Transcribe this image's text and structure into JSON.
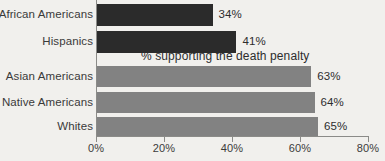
{
  "chart_data": {
    "type": "bar",
    "orientation": "horizontal",
    "title": "",
    "annotation": "% supporting the death penalty",
    "xlabel": "",
    "ylabel": "",
    "xlim": [
      0,
      80
    ],
    "grid": false,
    "legend": "none",
    "tick_labels": [
      "0%",
      "20%",
      "40%",
      "60%",
      "80%"
    ],
    "tick_values": [
      0,
      20,
      40,
      60,
      80
    ],
    "categories": [
      "African Americans",
      "Hispanics",
      "Asian Americans",
      "Native Americans",
      "Whites"
    ],
    "values": [
      34,
      41,
      63,
      64,
      65
    ],
    "value_labels": [
      "34%",
      "41%",
      "63%",
      "64%",
      "65%"
    ],
    "bar_colors": [
      "#2b2b2b",
      "#2b2b2b",
      "#828282",
      "#828282",
      "#828282"
    ],
    "bars": [
      {
        "category": "African Americans",
        "value": 34,
        "label": "34%",
        "color": "#2b2b2b",
        "top": 4,
        "height": 22
      },
      {
        "category": "Hispanics",
        "value": 41,
        "label": "41%",
        "color": "#2b2b2b",
        "top": 31,
        "height": 22
      },
      {
        "category": "Asian Americans",
        "value": 63,
        "label": "63%",
        "color": "#828282",
        "top": 66,
        "height": 21
      },
      {
        "category": "Native Americans",
        "value": 64,
        "label": "64%",
        "color": "#828282",
        "top": 92,
        "height": 21
      },
      {
        "category": "Whites",
        "value": 65,
        "label": "65%",
        "color": "#828282",
        "top": 117,
        "height": 19
      }
    ],
    "colors": {
      "background": "#f1f0ed",
      "axis": "#8b8b88",
      "text": "#3a3a3a",
      "dark_bar": "#2b2b2b",
      "light_bar": "#828282"
    }
  }
}
